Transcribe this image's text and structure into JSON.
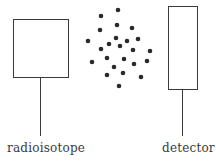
{
  "labels": {
    "source": "radioisotope",
    "detector": "detector"
  },
  "colors": {
    "stroke": "#3a3a3a",
    "particle": "#2a2a2a",
    "background": "#ffffff"
  },
  "diagram": {
    "source_box": {
      "x": 13,
      "y": 19,
      "w": 55,
      "h": 58
    },
    "source_stem": {
      "x": 40,
      "y1": 77,
      "y2": 136
    },
    "detector_box": {
      "x": 168,
      "y": 6,
      "w": 29,
      "h": 83
    },
    "detector_stem": {
      "x": 182,
      "y1": 89,
      "y2": 136
    },
    "particles": [
      [
        118,
        10
      ],
      [
        101,
        16
      ],
      [
        117,
        25
      ],
      [
        132,
        28
      ],
      [
        100,
        30
      ],
      [
        88,
        41
      ],
      [
        116,
        38
      ],
      [
        127,
        41
      ],
      [
        138,
        39
      ],
      [
        109,
        44
      ],
      [
        101,
        49
      ],
      [
        120,
        46
      ],
      [
        133,
        50
      ],
      [
        150,
        51
      ],
      [
        92,
        62
      ],
      [
        107,
        58
      ],
      [
        124,
        59
      ],
      [
        147,
        61
      ],
      [
        134,
        64
      ],
      [
        114,
        67
      ],
      [
        107,
        75
      ],
      [
        123,
        73
      ],
      [
        141,
        77
      ],
      [
        119,
        86
      ]
    ]
  }
}
